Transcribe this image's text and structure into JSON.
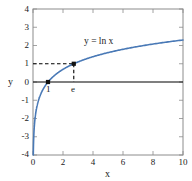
{
  "chart_data": {
    "type": "line",
    "title": "",
    "xlabel": "x",
    "ylabel": "y",
    "xlim": [
      0,
      10
    ],
    "ylim": [
      -4,
      4
    ],
    "grid": false,
    "legend": "none",
    "xticks": [
      "0",
      "2",
      "4",
      "6",
      "8",
      "10"
    ],
    "xtick_values": [
      0,
      2,
      4,
      6,
      8,
      10
    ],
    "yticks": [
      "4",
      "3",
      "2",
      "1",
      "0",
      "-1",
      "-2",
      "-3",
      "-4"
    ],
    "ytick_values": [
      4,
      3,
      2,
      1,
      0,
      -1,
      -2,
      -3,
      -4
    ],
    "series": [
      {
        "name": "y = ln x",
        "color": "#4979b6",
        "annotation": "y = ln x",
        "x": [
          0.03,
          0.05,
          0.08,
          0.12,
          0.18,
          0.25,
          0.35,
          0.5,
          0.7,
          1.0,
          1.4,
          1.8,
          2.2,
          2.718,
          3.2,
          4.0,
          5.0,
          6.0,
          7.0,
          8.0,
          9.0,
          10.0
        ],
        "y": [
          -3.51,
          -3.0,
          -2.53,
          -2.12,
          -1.71,
          -1.39,
          -1.05,
          -0.69,
          -0.36,
          0.0,
          0.34,
          0.59,
          0.79,
          1.0,
          1.16,
          1.39,
          1.61,
          1.79,
          1.95,
          2.08,
          2.2,
          2.3
        ]
      }
    ],
    "points": [
      {
        "label": "1",
        "x": 1.0,
        "y": 0.0
      },
      {
        "label": "e",
        "x": 2.718,
        "y": 1.0
      }
    ],
    "guides": [
      {
        "type": "horizontal-dashed",
        "from_x": 0,
        "to_x": 2.718,
        "y": 1
      },
      {
        "type": "vertical-dashed",
        "x": 2.718,
        "from_y": 0,
        "to_y": 1
      }
    ],
    "zero_line": {
      "y": 0,
      "color": "#000000"
    }
  },
  "colors": {
    "curve": "#4979b6",
    "frame": "#8c8c8c",
    "axis_zero": "#000000",
    "dash": "#000000",
    "marker": "#111111",
    "background": "#ffffff"
  },
  "labels": {
    "curve_annotation": "y = ln x",
    "x_axis": "x",
    "y_axis": "y",
    "point_one": "1",
    "point_e": "e"
  }
}
